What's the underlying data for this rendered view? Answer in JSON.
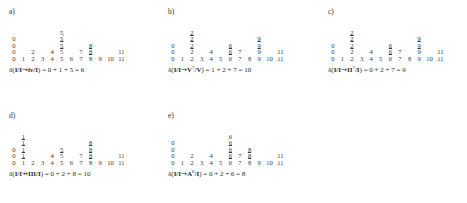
{
  "figure": {
    "type": "lattice-distance-diagram",
    "axis": {
      "ticks": [
        "0",
        "1",
        "2",
        "3",
        "4",
        "5",
        "6",
        "7",
        "8",
        "9",
        "10",
        "11"
      ],
      "min": 0,
      "max": 11
    }
  },
  "panels": [
    {
      "label": "a)",
      "rows": [
        [
          "",
          "",
          "",
          "",
          "",
          "5̲",
          "",
          "",
          "",
          "",
          "",
          ""
        ],
        [
          "0",
          "",
          "",
          "",
          "",
          "5̲",
          "",
          "",
          "",
          "",
          "",
          ""
        ],
        [
          "0",
          "",
          "",
          "",
          "",
          "5̲",
          "",
          "",
          "8̲",
          "",
          "",
          ""
        ],
        [
          "0",
          "",
          "2",
          "",
          "4",
          "5",
          "",
          "7",
          "8̲",
          "",
          "",
          "11"
        ],
        [
          "0",
          "1",
          "2",
          "3",
          "4",
          "5",
          "6",
          "7",
          "8",
          "9",
          "10",
          "11"
        ]
      ],
      "formula": {
        "delta": "δ(",
        "from": "I/I",
        "arrow": "→",
        "to_base": "iv/I",
        "to_sup": "",
        "close": ")",
        "equals": " = ",
        "terms": "0 + 1 + 5",
        "result": " = 6",
        "full": "δ(I/I→iv/I) = 0 + 1 + 5 = 6"
      }
    },
    {
      "label": "b)",
      "rows": [
        [
          "",
          "",
          "2̲",
          "",
          "",
          "",
          "",
          "",
          "",
          "",
          "",
          ""
        ],
        [
          "",
          "",
          "2̲",
          "",
          "",
          "",
          "",
          "",
          "",
          "9̲",
          "",
          ""
        ],
        [
          "0",
          "",
          "2̲",
          "",
          "",
          "",
          "6̲",
          "",
          "",
          "9̲",
          "",
          ""
        ],
        [
          "0",
          "",
          "2",
          "",
          "4",
          "",
          "6̲",
          "7",
          "",
          "9",
          "",
          "11"
        ],
        [
          "0",
          "1",
          "2",
          "3",
          "4",
          "5",
          "6",
          "7",
          "8",
          "9",
          "10",
          "11"
        ]
      ],
      "formula": {
        "delta": "δ(",
        "from": "I/I",
        "arrow": "→",
        "to_base": "V",
        "to_sup": "7",
        "to_tail": "/V",
        "close": ")",
        "equals": " = ",
        "terms": "1 + 2 + 7",
        "result": " = 10",
        "full": "δ(I/I→V⁷/V) = 1 + 2 + 7 = 10"
      }
    },
    {
      "label": "c)",
      "rows": [
        [
          "",
          "",
          "2̲",
          "",
          "",
          "",
          "",
          "",
          "",
          "",
          "",
          ""
        ],
        [
          "",
          "",
          "2̲",
          "",
          "",
          "",
          "",
          "",
          "",
          "9̲",
          "",
          ""
        ],
        [
          "0",
          "",
          "2̲",
          "",
          "",
          "",
          "6̲",
          "",
          "",
          "9̲",
          "",
          ""
        ],
        [
          "0",
          "",
          "2",
          "",
          "4",
          "",
          "6̲",
          "7",
          "",
          "9",
          "",
          "11"
        ],
        [
          "0",
          "1",
          "2",
          "3",
          "4",
          "5",
          "6",
          "7",
          "8",
          "9",
          "10",
          "11"
        ]
      ],
      "formula": {
        "delta": "δ(",
        "from": "I/I",
        "arrow": "→",
        "to_base": "II",
        "to_sup": "7",
        "to_tail": "/I",
        "close": ")",
        "equals": " = ",
        "terms": "0 + 2 + 7",
        "result": " = 9",
        "full": "δ(I/I→II⁷/I) = 0 + 2 + 7 = 9"
      }
    },
    {
      "label": "d)",
      "rows": [
        [
          "",
          "1̲",
          "",
          "",
          "",
          "",
          "",
          "",
          "",
          "",
          "",
          ""
        ],
        [
          "",
          "1̲",
          "",
          "",
          "",
          "",
          "",
          "",
          "8̲",
          "",
          "",
          ""
        ],
        [
          "0",
          "1̲",
          "",
          "",
          "",
          "5̲",
          "",
          "",
          "8̲",
          "",
          "",
          ""
        ],
        [
          "0",
          "1̲",
          "",
          "",
          "4",
          "5",
          "",
          "7",
          "8̲",
          "",
          "",
          "11"
        ],
        [
          "0",
          "1",
          "2",
          "3",
          "4",
          "5",
          "6",
          "7",
          "8",
          "9",
          "10",
          "11"
        ]
      ],
      "formula": {
        "delta": "δ(",
        "from": "I/I",
        "arrow": "⇸",
        "to_base": "III/I",
        "to_sup": "",
        "close": ")",
        "equals": " = ",
        "terms": "0 + 2 + 8",
        "result": " = 10",
        "full": "δ(I/I⇸III/I) = 0 + 2 + 8 = 10"
      }
    },
    {
      "label": "e)",
      "rows": [
        [
          "",
          "",
          "",
          "",
          "",
          "",
          "6̲",
          "",
          "",
          "",
          "",
          ""
        ],
        [
          "0",
          "",
          "",
          "",
          "",
          "",
          "6̲",
          "",
          "",
          "",
          "",
          ""
        ],
        [
          "0",
          "",
          "",
          "",
          "",
          "",
          "6̲",
          "",
          "8̲",
          "",
          "",
          ""
        ],
        [
          "0",
          "",
          "2",
          "",
          "4",
          "",
          "6̲",
          "7",
          "8̲",
          "",
          "",
          "11"
        ],
        [
          "0",
          "1",
          "2",
          "3",
          "4",
          "5",
          "6",
          "7",
          "8",
          "9",
          "10",
          "11"
        ]
      ],
      "formula": {
        "delta": "δ(",
        "from": "I/I",
        "arrow": "→",
        "to_base": "A",
        "to_sup": "6",
        "to_tail": "/I",
        "close": ")",
        "equals": " = ",
        "terms": "0 + 2 + 6",
        "result": " = 8",
        "full": "δ(I/I→A⁶/I) = 0 + 2 + 6 = 8"
      }
    }
  ]
}
